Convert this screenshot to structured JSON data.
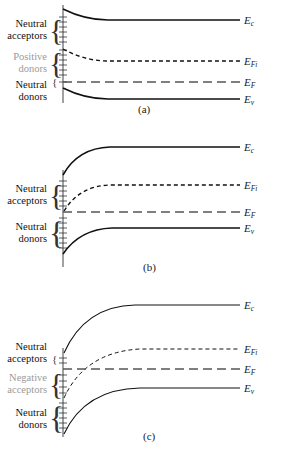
{
  "panels": [
    {
      "caption": "(a)",
      "energy_labels": {
        "Ec": "E",
        "Ec_sub": "c",
        "EFi": "E",
        "EFi_sub": "Fi",
        "EF": "E",
        "EF_sub": "F",
        "Ev": "E",
        "Ev_sub": "v"
      },
      "groups": [
        {
          "line1": "Neutral",
          "line2": "acceptors",
          "style": "black"
        },
        {
          "line1": "Positive",
          "line2": "donors",
          "style": "gray"
        },
        {
          "line1": "Neutral",
          "line2": "donors",
          "style": "black"
        }
      ]
    },
    {
      "caption": "(b)",
      "energy_labels": {
        "Ec": "E",
        "Ec_sub": "c",
        "EFi": "E",
        "EFi_sub": "Fi",
        "EF": "E",
        "EF_sub": "F",
        "Ev": "E",
        "Ev_sub": "v"
      },
      "groups": [
        {
          "line1": "Neutral",
          "line2": "acceptors",
          "style": "black"
        },
        {
          "line1": "Neutral",
          "line2": "donors",
          "style": "black"
        }
      ]
    },
    {
      "caption": "(c)",
      "energy_labels": {
        "Ec": "E",
        "Ec_sub": "c",
        "EFi": "E",
        "EFi_sub": "Fi",
        "EF": "E",
        "EF_sub": "F",
        "Ev": "E",
        "Ev_sub": "v"
      },
      "groups": [
        {
          "line1": "Neutral",
          "line2": "acceptors",
          "style": "black"
        },
        {
          "line1": "Negative",
          "line2": "acceptors",
          "style": "gray"
        },
        {
          "line1": "Neutral",
          "line2": "donors",
          "style": "black"
        }
      ]
    }
  ],
  "colors": {
    "line": "#111111",
    "gray_text": "#9a9a9a"
  }
}
